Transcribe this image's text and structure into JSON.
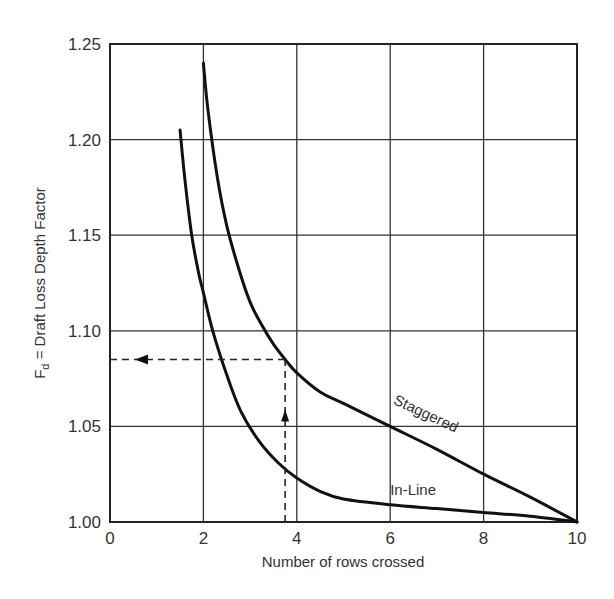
{
  "chart_data": {
    "type": "line",
    "title": "",
    "xlabel": "Number of rows crossed",
    "ylabel": "F_d = Draft Loss Depth Factor",
    "ylabel_main": "F",
    "ylabel_sub": "d",
    "ylabel_rest": " = Draft Loss Depth Factor",
    "xlim": [
      0,
      10
    ],
    "ylim": [
      1.0,
      1.25
    ],
    "xticks": [
      "0",
      "2",
      "4",
      "6",
      "8",
      "10"
    ],
    "yticks": [
      "1.00",
      "1.05",
      "1.10",
      "1.15",
      "1.20",
      "1.25"
    ],
    "grid": true,
    "series": [
      {
        "name": "Staggered",
        "x": [
          2.0,
          2.1,
          2.3,
          2.5,
          2.75,
          3.0,
          3.25,
          3.5,
          3.75,
          4.0,
          4.5,
          5.0,
          6.0,
          7.0,
          8.0,
          9.0,
          10.0
        ],
        "y": [
          1.24,
          1.215,
          1.18,
          1.155,
          1.133,
          1.115,
          1.103,
          1.093,
          1.085,
          1.078,
          1.068,
          1.062,
          1.05,
          1.038,
          1.025,
          1.013,
          1.0
        ]
      },
      {
        "name": "In-Line",
        "x": [
          1.5,
          1.6,
          1.75,
          1.9,
          2.0,
          2.2,
          2.5,
          2.8,
          3.2,
          3.6,
          4.0,
          4.5,
          5.0,
          6.0,
          7.0,
          8.0,
          9.0,
          10.0
        ],
        "y": [
          1.205,
          1.18,
          1.15,
          1.13,
          1.12,
          1.1,
          1.077,
          1.058,
          1.042,
          1.031,
          1.023,
          1.016,
          1.012,
          1.009,
          1.007,
          1.005,
          1.003,
          1.0
        ]
      }
    ],
    "annotations": [
      {
        "type": "dashed-guide",
        "description": "vertical from x-axis at 3.75 up to Staggered curve, then horizontal left to y-axis",
        "x": 3.75,
        "y": 1.085
      },
      {
        "type": "curve-label",
        "text": "Staggered",
        "x": 7.0,
        "y": 1.045
      },
      {
        "type": "curve-label",
        "text": "In-Line",
        "x": 7.0,
        "y": 1.017
      }
    ],
    "legend": "none (curves labeled inline)"
  }
}
